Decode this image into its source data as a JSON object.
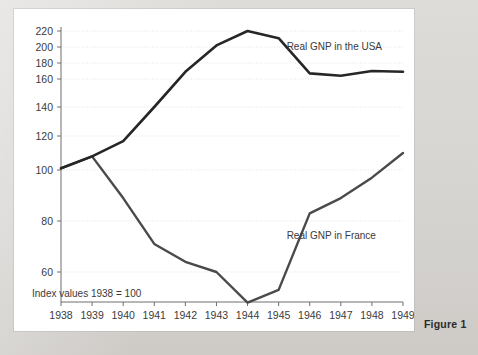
{
  "figure": {
    "caption": "Figure 1",
    "note": "Index values 1938 = 100"
  },
  "chart_data": {
    "type": "line",
    "title": "",
    "xlabel": "",
    "ylabel": "",
    "annotations": [
      "Index values 1938 = 100"
    ],
    "grid": true,
    "legend_position": "inline-right",
    "categories": [
      "1938",
      "1939",
      "1940",
      "1941",
      "1942",
      "1943",
      "1944",
      "1945",
      "1946",
      "1947",
      "1948",
      "1949"
    ],
    "x": [
      1938,
      1939,
      1940,
      1941,
      1942,
      1943,
      1944,
      1945,
      1946,
      1947,
      1948,
      1949
    ],
    "xlim": [
      1938,
      1949
    ],
    "ylim": [
      44,
      226
    ],
    "ytick_labels": [
      "220",
      "200",
      "180",
      "160",
      "140",
      "120",
      "100",
      "80",
      "60"
    ],
    "yticks": [
      220,
      200,
      180,
      160,
      140,
      120,
      100,
      80,
      60
    ],
    "series": [
      {
        "name": "Real GNP in the USA",
        "label": "Real GNP in the USA",
        "color": "#262626",
        "values": [
          101,
          108,
          117,
          140,
          169,
          202,
          220,
          211,
          167,
          164,
          170,
          169
        ]
      },
      {
        "name": "Real GNP in France",
        "label": "Real GNP in France",
        "color": "#4a4a4a",
        "values": [
          101,
          108,
          89,
          71,
          64,
          60,
          48,
          53,
          83,
          89,
          97,
          110
        ]
      }
    ]
  },
  "axis": {
    "x_tick_labels": [
      "1938",
      "1939",
      "1940",
      "1941",
      "1942",
      "1943",
      "1944",
      "1945",
      "1946",
      "1947",
      "1948",
      "1949"
    ],
    "y_tick_labels": [
      "220",
      "200",
      "180",
      "160",
      "140",
      "120",
      "100",
      "80",
      "60"
    ]
  },
  "colors": {
    "page_background": "#d9d9d7",
    "panel_background": "#ffffff",
    "axis": "#6e6e6e",
    "grid": "#e3e3e6",
    "usa_line": "#262626",
    "france_line": "#4a4a4a",
    "text": "#3a3a3a"
  }
}
